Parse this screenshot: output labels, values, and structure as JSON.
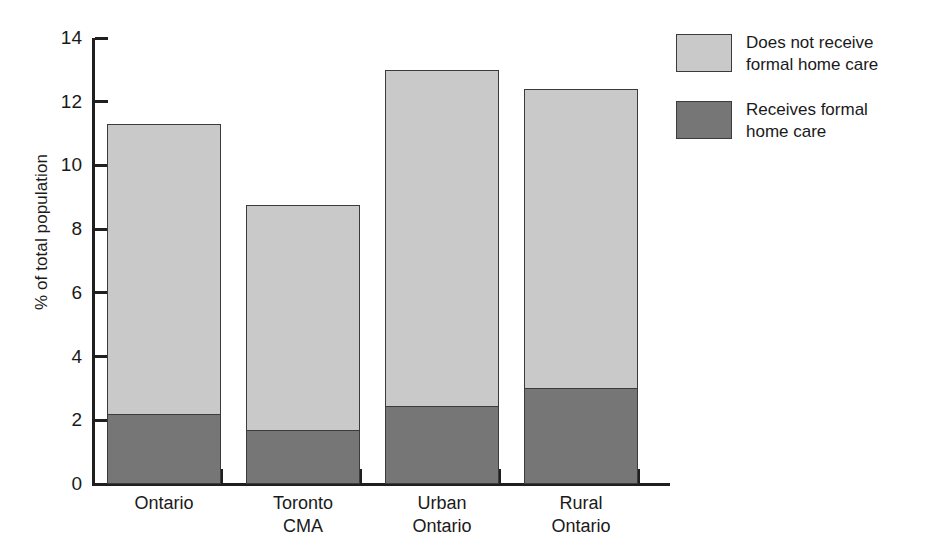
{
  "chart_data": {
    "type": "bar",
    "subtype": "stacked",
    "title": "",
    "xlabel": "",
    "ylabel": "% of total population",
    "ylim": [
      0,
      14
    ],
    "yticks": [
      0,
      2,
      4,
      6,
      8,
      10,
      12,
      14
    ],
    "ytick_labels": [
      "0",
      "2",
      "4",
      "6",
      "8",
      "10",
      "12",
      "14"
    ],
    "grid": false,
    "legend_position": "right",
    "categories": [
      "Ontario",
      "Toronto CMA",
      "Urban Ontario",
      "Rural Ontario"
    ],
    "category_lines": [
      [
        "Ontario"
      ],
      [
        "Toronto",
        "CMA"
      ],
      [
        "Urban",
        "Ontario"
      ],
      [
        "Rural",
        "Ontario"
      ]
    ],
    "series": [
      {
        "name": "Receives formal home care",
        "legend_lines": [
          "Receives formal",
          "home care"
        ],
        "color": "#767676",
        "values": [
          2.2,
          1.7,
          2.45,
          3.0
        ]
      },
      {
        "name": "Does not receive formal home care",
        "legend_lines": [
          "Does not receive",
          "formal home care"
        ],
        "color": "#c9c9c9",
        "values": [
          9.1,
          7.05,
          10.55,
          9.4
        ]
      }
    ],
    "totals": [
      11.3,
      8.75,
      13.0,
      12.4
    ]
  },
  "legend": {
    "items": [
      {
        "label": "Does not receive\nformal home care",
        "swatch_name": "legend-swatch-does-not-receive",
        "color": "#c9c9c9"
      },
      {
        "label": "Receives formal\nhome care",
        "swatch_name": "legend-swatch-receives",
        "color": "#767676"
      }
    ]
  },
  "axes": {
    "y_label": "% of total population"
  }
}
